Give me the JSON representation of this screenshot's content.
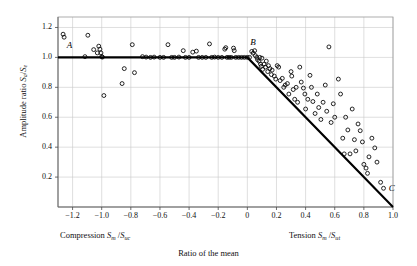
{
  "chart_data": {
    "type": "scatter",
    "title": "",
    "subtitle": "",
    "xlabel": "Ratio of the mean",
    "xlabel_left": "Compression S_m /S_uc",
    "xlabel_right": "Tension S_m /S_ut",
    "ylabel": "Amplitude ratio S_a /S_e",
    "xlim": [
      -1.3,
      1.0
    ],
    "ylim": [
      0,
      1.27
    ],
    "grid": true,
    "legend": null,
    "xticks": [
      -1.2,
      -1.0,
      -0.8,
      -0.6,
      -0.4,
      -0.2,
      0,
      0.2,
      0.4,
      0.6,
      0.8,
      1.0
    ],
    "xticklabels": [
      "−1.2",
      "−1.0",
      "−0.8",
      "−0.6",
      "−0.4",
      "−0.2",
      "0",
      "0.2",
      "0.4",
      "0.6",
      "0.8",
      "1.0"
    ],
    "yticks": [
      0.2,
      0.4,
      0.6,
      0.8,
      1.0,
      1.2
    ],
    "yticklabels": [
      "0.2",
      "0.4",
      "0.6",
      "0.8",
      "1.0",
      "1.2"
    ],
    "annotations": [
      {
        "text": "A",
        "x": -1.24,
        "y": 1.04
      },
      {
        "text": "B",
        "x": 0.02,
        "y": 1.06
      },
      {
        "text": "C",
        "x": 0.97,
        "y": 0.085
      }
    ],
    "series": [
      {
        "name": "Goodman failure line",
        "type": "line",
        "color": "#000000",
        "points": [
          [
            -1.3,
            1.0
          ],
          [
            0.0,
            1.0
          ],
          [
            1.0,
            0.0
          ]
        ]
      },
      {
        "name": "Test data",
        "type": "scatter",
        "marker": "open-circle",
        "color": "#000000",
        "points": [
          [
            -1.265,
            1.155
          ],
          [
            -1.258,
            1.135
          ],
          [
            -1.115,
            1.005
          ],
          [
            -1.095,
            1.148
          ],
          [
            -1.055,
            1.052
          ],
          [
            -1.03,
            1.03
          ],
          [
            -1.02,
            1.075
          ],
          [
            -1.012,
            1.055
          ],
          [
            -1.005,
            1.03
          ],
          [
            -1.0,
            1.005
          ],
          [
            -0.995,
            1.002
          ],
          [
            -0.985,
            0.745
          ],
          [
            -0.86,
            0.825
          ],
          [
            -0.845,
            0.925
          ],
          [
            -0.79,
            1.085
          ],
          [
            -0.775,
            0.898
          ],
          [
            -0.72,
            1.005
          ],
          [
            -0.695,
            1.002
          ],
          [
            -0.665,
            1.0
          ],
          [
            -0.64,
            1.002
          ],
          [
            -0.6,
            1.0
          ],
          [
            -0.575,
            1.0
          ],
          [
            -0.545,
            1.085
          ],
          [
            -0.52,
            1.0
          ],
          [
            -0.5,
            1.0
          ],
          [
            -0.47,
            1.002
          ],
          [
            -0.44,
            1.045
          ],
          [
            -0.425,
            1.0
          ],
          [
            -0.4,
            1.0
          ],
          [
            -0.375,
            1.035
          ],
          [
            -0.35,
            1.042
          ],
          [
            -0.335,
            1.0
          ],
          [
            -0.31,
            1.0
          ],
          [
            -0.285,
            1.0
          ],
          [
            -0.26,
            1.09
          ],
          [
            -0.245,
            1.0
          ],
          [
            -0.225,
            1.002
          ],
          [
            -0.2,
            1.0
          ],
          [
            -0.175,
            1.0
          ],
          [
            -0.155,
            1.055
          ],
          [
            -0.148,
            1.065
          ],
          [
            -0.14,
            1.0
          ],
          [
            -0.125,
            1.0
          ],
          [
            -0.11,
            1.0
          ],
          [
            -0.095,
            1.062
          ],
          [
            -0.09,
            1.045
          ],
          [
            -0.08,
            1.0
          ],
          [
            -0.06,
            1.0
          ],
          [
            -0.04,
            1.0
          ],
          [
            -0.02,
            1.0
          ],
          [
            0.0,
            1.0
          ],
          [
            0.015,
            1.0
          ],
          [
            0.03,
            1.04
          ],
          [
            0.04,
            1.028
          ],
          [
            0.05,
            1.045
          ],
          [
            0.055,
            1.012
          ],
          [
            0.065,
            1.0
          ],
          [
            0.07,
            0.985
          ],
          [
            0.08,
            0.975
          ],
          [
            0.085,
            1.0
          ],
          [
            0.09,
            0.955
          ],
          [
            0.095,
            0.94
          ],
          [
            0.1,
            0.995
          ],
          [
            0.105,
            0.92
          ],
          [
            0.115,
            0.955
          ],
          [
            0.125,
            0.935
          ],
          [
            0.13,
            0.975
          ],
          [
            0.14,
            0.905
          ],
          [
            0.145,
            0.945
          ],
          [
            0.155,
            0.925
          ],
          [
            0.165,
            0.885
          ],
          [
            0.17,
            0.915
          ],
          [
            0.185,
            0.875
          ],
          [
            0.195,
            0.855
          ],
          [
            0.205,
            0.945
          ],
          [
            0.215,
            0.935
          ],
          [
            0.225,
            0.845
          ],
          [
            0.24,
            0.86
          ],
          [
            0.25,
            0.8
          ],
          [
            0.26,
            0.815
          ],
          [
            0.275,
            0.825
          ],
          [
            0.285,
            0.755
          ],
          [
            0.3,
            0.905
          ],
          [
            0.305,
            0.875
          ],
          [
            0.315,
            0.785
          ],
          [
            0.325,
            0.72
          ],
          [
            0.335,
            0.8
          ],
          [
            0.345,
            0.7
          ],
          [
            0.36,
            0.935
          ],
          [
            0.37,
            0.835
          ],
          [
            0.385,
            0.795
          ],
          [
            0.395,
            0.755
          ],
          [
            0.4,
            0.655
          ],
          [
            0.415,
            0.72
          ],
          [
            0.43,
            0.88
          ],
          [
            0.44,
            0.8
          ],
          [
            0.45,
            0.705
          ],
          [
            0.465,
            0.625
          ],
          [
            0.48,
            0.755
          ],
          [
            0.49,
            0.665
          ],
          [
            0.505,
            0.585
          ],
          [
            0.52,
            0.7
          ],
          [
            0.535,
            0.815
          ],
          [
            0.545,
            0.64
          ],
          [
            0.56,
            1.07
          ],
          [
            0.575,
            0.565
          ],
          [
            0.59,
            0.69
          ],
          [
            0.6,
            0.6
          ],
          [
            0.625,
            0.855
          ],
          [
            0.64,
            0.755
          ],
          [
            0.655,
            0.46
          ],
          [
            0.665,
            0.355
          ],
          [
            0.675,
            0.6
          ],
          [
            0.69,
            0.515
          ],
          [
            0.705,
            0.355
          ],
          [
            0.72,
            0.655
          ],
          [
            0.735,
            0.45
          ],
          [
            0.745,
            0.375
          ],
          [
            0.76,
            0.555
          ],
          [
            0.775,
            0.51
          ],
          [
            0.79,
            0.435
          ],
          [
            0.8,
            0.285
          ],
          [
            0.815,
            0.26
          ],
          [
            0.825,
            0.225
          ],
          [
            0.835,
            0.335
          ],
          [
            0.855,
            0.46
          ],
          [
            0.875,
            0.395
          ],
          [
            0.89,
            0.3
          ],
          [
            0.915,
            0.165
          ],
          [
            0.935,
            0.125
          ]
        ]
      }
    ]
  },
  "labels": {
    "ylabel_pre": "Amplitude ratio ",
    "ylabel_sa": "S",
    "ylabel_sa_sub": "a",
    "ylabel_slash": "/",
    "ylabel_se": "S",
    "ylabel_se_sub": "e",
    "xleft_pre": "Compression ",
    "xleft_sm": "S",
    "xleft_sm_sub": "m",
    "xleft_slash": " /",
    "xleft_suc": "S",
    "xleft_suc_sub": "uc",
    "xright_pre": "Tension ",
    "xright_sm": "S",
    "xright_sm_sub": "m",
    "xright_slash": " /",
    "xright_sut": "S",
    "xright_sut_sub": "ut",
    "xcenter": "Ratio of the mean"
  }
}
